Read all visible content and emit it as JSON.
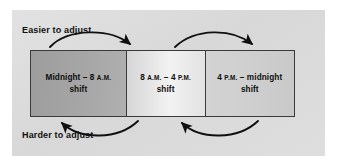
{
  "figure": {
    "title_label_top": "Easier to adjust",
    "title_label_bottom": "Harder to adjust"
  },
  "colors": {
    "panel_background": "#dcdcdc",
    "page_background": "#ffffff",
    "box_border": "#3a3a3a",
    "box_1_fill": "#a7a7a7",
    "box_2_fill": "#f2f2f2",
    "box_3_fill": "#cfcfcf",
    "arrow_stroke": "#101010",
    "text": "#0d0d0d"
  },
  "boxes": [
    {
      "id": "box-1",
      "line1_pre": "Midnight – 8 ",
      "line1_smallcaps": "A.M.",
      "line2": "shift"
    },
    {
      "id": "box-2",
      "line1_pre": "8 ",
      "line1_smallcaps": "A.M.",
      "line1_mid": " – 4 ",
      "line1_smallcaps_2": "P.M.",
      "line2": "shift"
    },
    {
      "id": "box-3",
      "line1_pre": "4 ",
      "line1_smallcaps": "P.M.",
      "line1_mid": " – midnight",
      "line2": "shift"
    }
  ],
  "arrows": {
    "top": [
      {
        "name": "arrow-box1-to-box2",
        "direction": "right",
        "from": "box-1",
        "to": "box-2"
      },
      {
        "name": "arrow-box2-to-box3",
        "direction": "right",
        "from": "box-2",
        "to": "box-3"
      }
    ],
    "bottom": [
      {
        "name": "arrow-box2-to-box1",
        "direction": "left",
        "from": "box-2",
        "to": "box-1"
      },
      {
        "name": "arrow-box3-to-box2",
        "direction": "left",
        "from": "box-3",
        "to": "box-2"
      }
    ]
  }
}
